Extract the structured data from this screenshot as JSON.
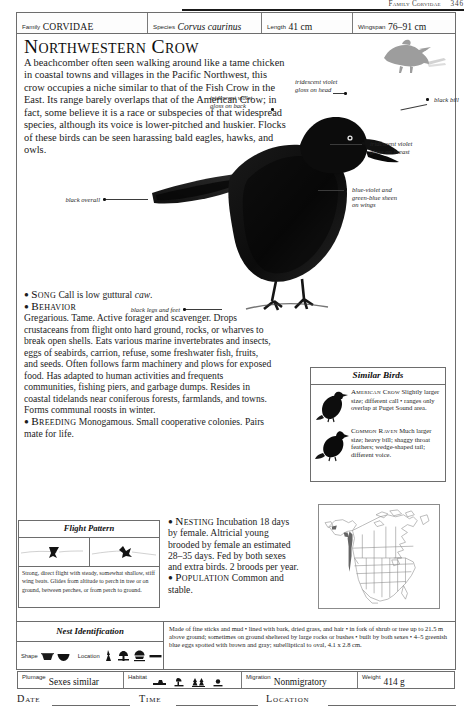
{
  "running_head": {
    "title": "Family Corvidae",
    "page": "346"
  },
  "stats": [
    {
      "key": "Family",
      "value": "CORVIDAE",
      "style": "smallcaps"
    },
    {
      "key": "Species",
      "value": "Corvus caurinus",
      "style": "italic"
    },
    {
      "key": "Length",
      "value": "41 cm",
      "style": "plain"
    },
    {
      "key": "Wingspan",
      "value": "76–91 cm",
      "style": "plain"
    }
  ],
  "title": "Northwestern Crow",
  "intro": "A beachcomber often seen walking around like a tame chicken in coastal towns and villages in the Pacific Northwest, this crow occupies a niche similar to that of the Fish Crow in the East. Its range barely overlaps that of the American Crow; in fact, some believe it is a race or subspecies of that widespread species, although its voice is lower-pitched and huskier. Flocks of these birds can be seen harassing bald eagles, hawks, and owls.",
  "callouts": [
    {
      "id": "head-gloss",
      "text": "iridescent violet\ngloss on head"
    },
    {
      "id": "back-gloss",
      "text": "iridescent violet\ngloss on back"
    },
    {
      "id": "black-bill",
      "text": "black bill"
    },
    {
      "id": "breast-gloss",
      "text": "iridescent violet\ngloss on breast"
    },
    {
      "id": "wing-sheen",
      "text": "blue-violet and\ngreen-blue sheen\non wings"
    },
    {
      "id": "black-overall",
      "text": "black overall"
    },
    {
      "id": "legs-feet",
      "text": "black legs and feet"
    }
  ],
  "sections": {
    "song": {
      "head": "Song",
      "body": "Call is low guttural caw.",
      "body_italic": "caw"
    },
    "behavior": {
      "head": "Behavior",
      "body": "Gregarious. Tame. Active forager and scavenger. Drops crustaceans from flight onto hard ground, rocks, or wharves to break open shells. Eats various marine invertebrates and insects, eggs of seabirds, carrion, refuse, some freshwater fish, fruits, and seeds. Often follows farm machinery and plows for exposed food. Has adapted to human activities and frequents communities, fishing piers, and garbage dumps. Resides in coastal tidelands near coniferous forests, farmlands, and towns. Forms communal roosts in winter."
    },
    "breeding": {
      "head": "Breeding",
      "body": "Monogamous. Small cooperative colonies. Pairs mate for life."
    },
    "nesting": {
      "head": "Nesting",
      "body": "Incubation 18 days by female. Altricial young brooded by female an estimated 28–35 days. Fed by both sexes and extra birds. 2 broods per year."
    },
    "population": {
      "head": "Population",
      "body": "Common and stable."
    }
  },
  "similar_birds": {
    "title": "Similar Birds",
    "entries": [
      {
        "name": "American Crow",
        "text": "Slightly larger size; different call • ranges only overlap at Puget Sound area."
      },
      {
        "name": "Common Raven",
        "text": "Much larger size; heavy bill; shaggy throat feathers; wedge-shaped tail; different voice."
      }
    ]
  },
  "flight_pattern": {
    "title": "Flight Pattern",
    "caption": "Strong, direct flight with steady, somewhat shallow, stiff wing beats. Glides from altitude to perch in tree or on ground, between perches, or from perch to ground."
  },
  "nest_identification": {
    "title": "Nest Identification",
    "shape_label": "Shape",
    "location_label": "Location",
    "text": "Made of fine sticks and mud • lined with bark, dried grass, and hair • in fork of shrub or tree up to 21.5 m above ground; sometimes on ground sheltered by large rocks or bushes • built by both sexes • 4–5 greenish blue eggs spotted with brown and gray; subelliptical to oval, 4.1 x 2.8 cm."
  },
  "bottom_bar": [
    {
      "key": "Plumage",
      "value": "Sexes similar"
    },
    {
      "key": "Habitat",
      "value": ""
    },
    {
      "key": "Migration",
      "value": "Nonmigratory"
    },
    {
      "key": "Weight",
      "value": "414 g"
    }
  ],
  "footer": [
    {
      "label": "Date"
    },
    {
      "label": "Time"
    },
    {
      "label": "Location"
    }
  ],
  "colors": {
    "rule": "#6d6d6d",
    "ink": "#161616",
    "map_range": "#4a4a4a",
    "fly_crow": "#9a9a9a"
  }
}
